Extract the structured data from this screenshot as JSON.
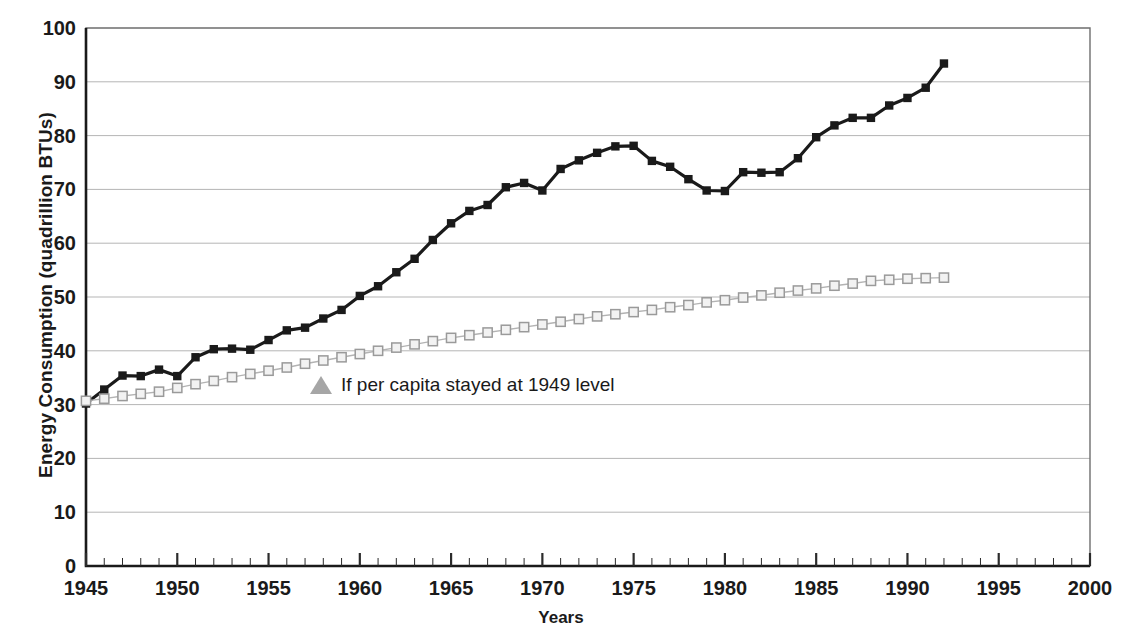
{
  "chart_data": {
    "type": "line",
    "title": "",
    "xlabel": "Years",
    "ylabel": "Energy Consumption (quadrillion BTUs)",
    "xlim": [
      1945,
      2000
    ],
    "ylim": [
      0,
      100
    ],
    "ytick_labels": [
      "0",
      "10",
      "20",
      "30",
      "40",
      "50",
      "60",
      "70",
      "80",
      "90",
      "100"
    ],
    "ytick_values": [
      0,
      10,
      20,
      30,
      40,
      50,
      60,
      70,
      80,
      90,
      100
    ],
    "xtick_labels": [
      "1945",
      "1950",
      "1955",
      "1960",
      "1965",
      "1970",
      "1975",
      "1980",
      "1985",
      "1990",
      "1995",
      "2000"
    ],
    "xtick_values": [
      1945,
      1950,
      1955,
      1960,
      1965,
      1970,
      1975,
      1980,
      1985,
      1990,
      1995,
      2000
    ],
    "minor_xticks": "yearly",
    "grid": "horizontal",
    "legend_position": "inside-center-left",
    "series": [
      {
        "name": "Actual energy consumption",
        "marker": "filled-square",
        "color": "#1a1a1a",
        "x": [
          1945,
          1946,
          1947,
          1948,
          1949,
          1950,
          1951,
          1952,
          1953,
          1954,
          1955,
          1956,
          1957,
          1958,
          1959,
          1960,
          1961,
          1962,
          1963,
          1964,
          1965,
          1966,
          1967,
          1968,
          1969,
          1970,
          1971,
          1972,
          1973,
          1974,
          1975,
          1976,
          1977,
          1978,
          1979,
          1980,
          1981,
          1982,
          1983,
          1984,
          1985,
          1986,
          1987,
          1988,
          1989,
          1990,
          1991,
          1992
        ],
        "values": [
          30.2,
          32.8,
          35.4,
          35.3,
          36.5,
          35.3,
          38.8,
          40.3,
          40.4,
          40.2,
          42.0,
          43.8,
          44.3,
          46.0,
          47.6,
          50.2,
          52.0,
          54.6,
          57.1,
          60.6,
          63.7,
          66.0,
          67.1,
          70.4,
          71.2,
          69.8,
          73.8,
          75.4,
          76.8,
          78.0,
          78.1,
          75.3,
          74.2,
          71.9,
          69.8,
          69.7,
          73.2,
          73.1,
          73.2,
          75.8,
          79.7,
          81.9,
          83.3,
          83.3,
          85.6,
          87.0,
          88.9,
          93.4
        ]
      },
      {
        "name": "If per capita stayed at 1949 level",
        "marker": "open-square",
        "color": "#b3b3b3",
        "x": [
          1945,
          1946,
          1947,
          1948,
          1949,
          1950,
          1951,
          1952,
          1953,
          1954,
          1955,
          1956,
          1957,
          1958,
          1959,
          1960,
          1961,
          1962,
          1963,
          1964,
          1965,
          1966,
          1967,
          1968,
          1969,
          1970,
          1971,
          1972,
          1973,
          1974,
          1975,
          1976,
          1977,
          1978,
          1979,
          1980,
          1981,
          1982,
          1983,
          1984,
          1985,
          1986,
          1987,
          1988,
          1989,
          1990,
          1991,
          1992
        ],
        "values": [
          30.7,
          31.1,
          31.6,
          32.0,
          32.4,
          33.1,
          33.8,
          34.4,
          35.1,
          35.7,
          36.3,
          36.9,
          37.6,
          38.2,
          38.8,
          39.4,
          40.0,
          40.6,
          41.2,
          41.8,
          42.4,
          42.9,
          43.4,
          43.9,
          44.4,
          44.9,
          45.4,
          45.9,
          46.4,
          46.8,
          47.2,
          47.6,
          48.1,
          48.5,
          49.0,
          49.4,
          49.9,
          50.3,
          50.8,
          51.2,
          51.6,
          52.1,
          52.5,
          53.0,
          53.2,
          53.4,
          53.5,
          53.6
        ]
      }
    ],
    "legend_label": "If per capita stayed at 1949 level"
  }
}
